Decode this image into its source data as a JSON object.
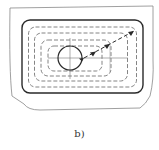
{
  "figure": {
    "caption": "b)"
  },
  "colors": {
    "line": "#2a2a2a",
    "thin_line": "#777777",
    "dashed": "#666666",
    "background": "#ffffff"
  }
}
